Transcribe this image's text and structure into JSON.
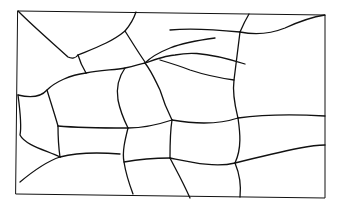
{
  "diagram": {
    "stroke_color": "#111111",
    "background": "#ffffff",
    "frame": "M18,11 L325,15 L325,198 L16,194 Z",
    "paths": [
      "M18,11 C35,28 55,45 68,57 C72,59 76,58 78,55",
      "M78,55 C95,48 112,42 125,31 C131,24 134,18 136,12",
      "M125,31 C132,42 138,52 145,62",
      "M78,55 C80,62 83,68 86,73",
      "M86,73 C100,70 115,70 125,68 C135,66 140,64 145,63",
      "M145,63 C160,58 168,55 175,55 C185,53 200,50 245,64",
      "M145,63 C152,72 155,80 160,90 C163,100 168,112 172,120",
      "M145,63 C152,56 160,52 170,48 C185,42 200,40 215,38",
      "M170,30 C190,28 220,30 240,32",
      "M240,32 C243,25 246,19 249,14",
      "M240,32 C255,35 270,34 285,28 C298,22 312,17 325,15",
      "M240,32 C238,48 236,64 234,80 C232,95 236,110 238,118",
      "M234,80 C220,78 205,75 190,70 C180,66 170,63 160,60",
      "M238,118 C260,115 290,114 325,116",
      "M86,73 C70,75 55,82 47,90 C40,98 30,98 18,95",
      "M47,90 C50,100 54,112 58,126",
      "M125,68 C118,78 116,88 118,100 C120,110 124,120 128,128",
      "M58,126 C80,128 105,128 128,128 C145,128 160,124 172,120",
      "M172,120 C195,124 220,124 238,118",
      "M58,126 C58,138 59,150 60,157",
      "M60,157 C75,153 95,152 120,154",
      "M128,128 C125,140 122,152 124,162 C126,175 130,186 133,194",
      "M124,162 C135,160 150,158 170,158",
      "M170,158 C190,162 215,168 235,163",
      "M235,163 C255,158 280,152 300,148 C310,146 318,145 325,145",
      "M238,118 C240,132 242,148 235,163 C240,175 241,188 240,197",
      "M172,120 C170,132 170,146 170,158",
      "M170,158 C175,168 182,180 190,198",
      "M60,157 C45,162 32,172 20,182",
      "M18,95 C20,110 22,125 20,135 C25,145 45,150 60,157"
    ]
  }
}
